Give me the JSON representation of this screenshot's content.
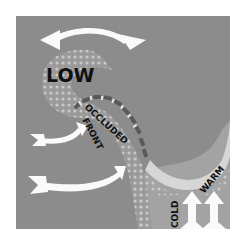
{
  "diagram": {
    "labels": {
      "low": "LOW",
      "occluded_line1": "OCCLUDED",
      "occluded_line2": "FRONT",
      "cold": "COLD",
      "warm": "WARM"
    },
    "colors": {
      "background": "#ffffff",
      "panel": "#8c8c8c",
      "cold_air": "#a9a9a9",
      "dots": "#c8c8c8",
      "warm_band": "#d6d6d6",
      "arrow": "#fafafa",
      "front_dash": "#595959",
      "text": "#111111"
    },
    "arrows": [
      {
        "name": "top-arrow",
        "direction": "left-curved"
      },
      {
        "name": "middle-arrow",
        "direction": "right-curved"
      },
      {
        "name": "lower-arrow",
        "direction": "right-curved"
      },
      {
        "name": "cold-up-arrow",
        "direction": "up"
      },
      {
        "name": "warm-up-arrow",
        "direction": "up"
      }
    ]
  }
}
